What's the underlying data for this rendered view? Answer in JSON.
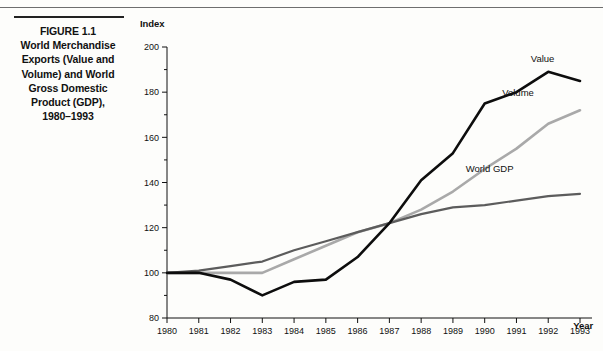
{
  "figure": {
    "caption_lines": [
      "FIGURE 1.1",
      "World Merchandise",
      "Exports (Value and",
      "Volume) and World",
      "Gross Domestic",
      "Product (GDP),",
      "1980–1993"
    ]
  },
  "chart_data": {
    "type": "line",
    "title": "",
    "xlabel": "Year",
    "ylabel": "Index",
    "x": [
      1980,
      1981,
      1982,
      1983,
      1984,
      1985,
      1986,
      1987,
      1988,
      1989,
      1990,
      1991,
      1992,
      1993
    ],
    "xtick_labels": [
      "1980",
      "1981",
      "1982",
      "1983",
      "1984",
      "1985",
      "1986",
      "1987",
      "1988",
      "1989",
      "1990",
      "1991",
      "1992",
      "1993"
    ],
    "ytick_labels": [
      "80",
      "100",
      "120",
      "140",
      "160",
      "180",
      "200"
    ],
    "ytick_values": [
      80,
      100,
      120,
      140,
      160,
      180,
      200
    ],
    "yminor_values": [
      90,
      110,
      130,
      150,
      170,
      190
    ],
    "ylim": [
      80,
      200
    ],
    "xlim": [
      1980,
      1993
    ],
    "grid": false,
    "legend": "inline-labels",
    "series": [
      {
        "name": "Value",
        "color": "#0d0d0d",
        "width": 2.6,
        "label_x": 1991.45,
        "label_y": 193.5,
        "values": [
          100,
          100,
          97,
          90,
          96,
          97,
          107,
          122,
          141,
          153,
          175,
          180,
          189,
          185
        ]
      },
      {
        "name": "Volume",
        "color": "#a9a9a9",
        "width": 2.6,
        "label_x": 1990.55,
        "label_y": 178.5,
        "values": [
          100,
          100,
          100,
          100,
          106,
          112,
          118,
          122,
          128,
          136,
          146,
          155,
          166,
          172
        ]
      },
      {
        "name": "World GDP",
        "color": "#5c5c5c",
        "width": 2.2,
        "label_x": 1989.4,
        "label_y": 144.5,
        "values": [
          100,
          101,
          103,
          105,
          110,
          114,
          118,
          122,
          126,
          129,
          130,
          132,
          134,
          135
        ]
      }
    ]
  }
}
